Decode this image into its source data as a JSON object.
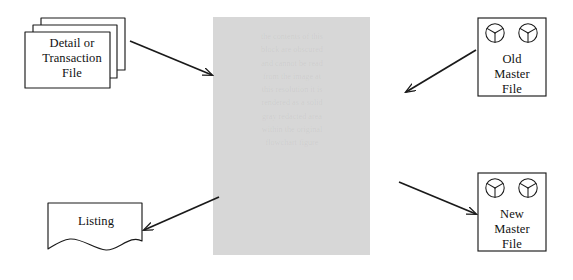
{
  "diagram": {
    "type": "data-processing-flowchart",
    "canvas": {
      "width": 573,
      "height": 280,
      "background": "#ffffff"
    },
    "stroke_color": "#1a1a1a",
    "process_block": {
      "name": "process-block",
      "fill": "#d7d7d7",
      "x": 213,
      "y": 17,
      "width": 157,
      "height": 238,
      "obscured_text": "the contents of this\nblock are obscured\nand cannot be read\nfrom the image at\nthis resolution it is\nrendered as a solid\ngray redacted area\nwithin the original\nflowchart figure"
    },
    "nodes": [
      {
        "id": "detail-transaction-file",
        "shape": "stacked-document",
        "label": "Detail or\nTransaction\nFile",
        "x": 25,
        "y": 18,
        "width": 100,
        "height": 70
      },
      {
        "id": "old-master-file",
        "shape": "magnetic-tape",
        "label": "Old\nMaster\nFile",
        "reels": 2,
        "x": 478,
        "y": 18,
        "width": 68,
        "height": 78
      },
      {
        "id": "new-master-file",
        "shape": "magnetic-tape",
        "label": "New\nMaster\nFile",
        "reels": 2,
        "x": 478,
        "y": 173,
        "width": 68,
        "height": 78
      },
      {
        "id": "listing",
        "shape": "wavy-bottom-document",
        "label": "Listing",
        "x": 48,
        "y": 203,
        "width": 94,
        "height": 48
      }
    ],
    "arrows": [
      {
        "id": "arrow-detail-to-process",
        "from": "detail-transaction-file",
        "to": "process-block",
        "direction": "down-right",
        "x1": 130,
        "y1": 41,
        "x2": 213,
        "y2": 76
      },
      {
        "id": "arrow-old-master-to-process",
        "from": "old-master-file",
        "to": "process-block",
        "direction": "down-left",
        "x1": 476,
        "y1": 50,
        "x2": 405,
        "y2": 93
      },
      {
        "id": "arrow-process-to-new-master",
        "from": "process-block",
        "to": "new-master-file",
        "direction": "down-right",
        "x1": 400,
        "y1": 183,
        "x2": 477,
        "y2": 215
      },
      {
        "id": "arrow-process-to-listing",
        "from": "process-block",
        "to": "listing",
        "direction": "down-left",
        "x1": 218,
        "y1": 198,
        "x2": 143,
        "y2": 231
      }
    ]
  },
  "labels": {
    "detail_transaction_file": "Detail or\nTransaction\nFile",
    "old_master_file": "Old\nMaster\nFile",
    "new_master_file": "New\nMaster\nFile",
    "listing": "Listing"
  },
  "icons": {
    "tape_reel": "tape-reel-icon"
  }
}
